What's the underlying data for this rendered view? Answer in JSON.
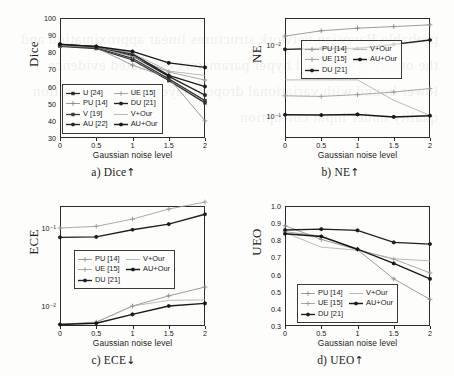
{
  "figure": {
    "xlabel": "Gaussian noise level",
    "xticks": [
      "0",
      "0.5",
      "1",
      "1.5",
      "2"
    ],
    "ghost_text": "probable Bayesian network structures linear approximation and the ordering of model hyper parameters estimated evidence lower bound with variational dropout layers the segmentation quality under input corruption"
  },
  "series_styles": {
    "U [24]": {
      "color": "#2c2c2c",
      "marker": "square",
      "width": 1.25
    },
    "PU [14]": {
      "color": "#8a8a8a",
      "marker": "plus",
      "width": 0.85
    },
    "V [19]": {
      "color": "#3a3a3a",
      "marker": "square",
      "width": 1.25
    },
    "AU [22]": {
      "color": "#272727",
      "marker": "hex",
      "width": 1.35
    },
    "UE [15]": {
      "color": "#9a9a9a",
      "marker": "plus",
      "width": 0.85
    },
    "DU [21]": {
      "color": "#1f1f1f",
      "marker": "hex",
      "width": 1.35
    },
    "V+Our": {
      "color": "#a8a8a8",
      "marker": "line",
      "width": 0.8
    },
    "AU+Our": {
      "color": "#181818",
      "marker": "hex",
      "width": 1.45
    }
  },
  "chart_data": [
    {
      "id": "dice",
      "type": "line",
      "panel_label": "a)",
      "metric": "Dice",
      "direction_arrow": "↑",
      "caption": "a) Dice",
      "title": "",
      "xlabel": "Gaussian noise level",
      "ylabel": "Dice",
      "yscale": "linear",
      "x": [
        0,
        0.5,
        1,
        1.5,
        2
      ],
      "ylim": [
        30,
        100
      ],
      "yticks": [
        30,
        40,
        50,
        60,
        70,
        80,
        90,
        100
      ],
      "grid": false,
      "legend_position": "lower left",
      "legend_columns": 2,
      "series": [
        {
          "name": "U [24]",
          "values": [
            83.5,
            82.2,
            75.5,
            63.5,
            50.5
          ]
        },
        {
          "name": "PU [14]",
          "values": [
            83.8,
            82.6,
            72.5,
            65.0,
            40.0
          ]
        },
        {
          "name": "V [19]",
          "values": [
            84.0,
            82.6,
            76.5,
            64.5,
            51.8
          ]
        },
        {
          "name": "AU [22]",
          "values": [
            84.8,
            83.3,
            78.0,
            66.0,
            55.0
          ]
        },
        {
          "name": "UE [15]",
          "values": [
            84.2,
            83.0,
            77.5,
            68.5,
            63.8
          ]
        },
        {
          "name": "DU [21]",
          "values": [
            84.5,
            83.2,
            79.0,
            66.5,
            60.0
          ]
        },
        {
          "name": "V+Our",
          "values": [
            84.0,
            83.0,
            79.5,
            69.0,
            66.5
          ]
        },
        {
          "name": "AU+Our",
          "values": [
            84.6,
            83.4,
            80.5,
            73.8,
            71.2
          ]
        }
      ]
    },
    {
      "id": "ne",
      "type": "line",
      "panel_label": "b)",
      "metric": "NE",
      "direction_arrow": "↑",
      "caption": "b) NE",
      "title": "",
      "xlabel": "Gaussian noise level",
      "ylabel": "NE",
      "yscale": "log-inverted",
      "x": [
        0,
        0.5,
        1,
        1.5,
        2
      ],
      "yticks_labels": [
        "10⁻²",
        "10⁻¹"
      ],
      "grid": false,
      "legend_position": "upper center-left",
      "legend_columns": 2,
      "series": [
        {
          "name": "PU [14]",
          "values": [
            0.0075,
            0.0063,
            0.0058,
            0.0055,
            0.0052
          ]
        },
        {
          "name": "UE [15]",
          "values": [
            0.052,
            0.053,
            0.05,
            0.046,
            0.041
          ]
        },
        {
          "name": "DU [21]",
          "values": [
            0.0115,
            0.0112,
            0.0112,
            0.0098,
            0.0085
          ]
        },
        {
          "name": "V+Our",
          "values": [
            0.031,
            0.031,
            0.031,
            0.06,
            0.098
          ]
        },
        {
          "name": "AU+Our",
          "values": [
            0.096,
            0.097,
            0.095,
            0.103,
            0.099
          ]
        }
      ]
    },
    {
      "id": "ece",
      "type": "line",
      "panel_label": "c)",
      "metric": "ECE",
      "direction_arrow": "↓",
      "caption": "c) ECE",
      "title": "",
      "xlabel": "Gaussian noise level",
      "ylabel": "ECE",
      "yscale": "log",
      "x": [
        0,
        0.5,
        1,
        1.5,
        2
      ],
      "yticks_labels": [
        "10⁻¹",
        "10⁻²"
      ],
      "grid": false,
      "legend_position": "center-left",
      "legend_columns": 2,
      "series": [
        {
          "name": "PU [14]",
          "values": [
            0.0058,
            0.0062,
            0.01,
            0.0135,
            0.0175
          ]
        },
        {
          "name": "UE [15]",
          "values": [
            0.1,
            0.105,
            0.13,
            0.175,
            0.215
          ]
        },
        {
          "name": "DU [21]",
          "values": [
            0.076,
            0.077,
            0.095,
            0.112,
            0.15
          ]
        },
        {
          "name": "V+Our",
          "values": [
            0.0058,
            0.0062,
            0.01,
            0.0118,
            0.012
          ]
        },
        {
          "name": "AU+Our",
          "values": [
            0.0058,
            0.006,
            0.0078,
            0.01,
            0.0108
          ]
        }
      ]
    },
    {
      "id": "ueo",
      "type": "line",
      "panel_label": "d)",
      "metric": "UEO",
      "direction_arrow": "↑",
      "caption": "d) UEO",
      "title": "",
      "xlabel": "Gaussian noise level",
      "ylabel": "UEO",
      "yscale": "linear",
      "x": [
        0,
        0.5,
        1,
        1.5,
        2
      ],
      "ylim": [
        0.3,
        1.0
      ],
      "yticks": [
        0.3,
        0.4,
        0.5,
        0.6,
        0.7,
        0.8,
        0.9,
        1.0
      ],
      "grid": false,
      "legend_position": "lower left",
      "legend_columns": 2,
      "series": [
        {
          "name": "PU [14]",
          "values": [
            0.885,
            0.805,
            0.745,
            0.575,
            0.455
          ]
        },
        {
          "name": "UE [15]",
          "values": [
            0.85,
            0.825,
            0.745,
            0.69,
            0.61
          ]
        },
        {
          "name": "DU [21]",
          "values": [
            0.86,
            0.865,
            0.858,
            0.788,
            0.778
          ]
        },
        {
          "name": "V+Our",
          "values": [
            0.845,
            0.76,
            0.742,
            0.692,
            0.68
          ]
        },
        {
          "name": "AU+Our",
          "values": [
            0.838,
            0.822,
            0.748,
            0.665,
            0.575
          ]
        }
      ]
    }
  ]
}
